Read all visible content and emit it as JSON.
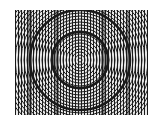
{
  "image": {
    "description": "Moire pattern of concentric circles overlaid on vertical lines",
    "background": "#ffffff",
    "ink": "#1a1a1a",
    "bounds": {
      "x": 15,
      "y": 10,
      "width": 133,
      "height": 105
    },
    "center": {
      "x": 80,
      "y": 60
    },
    "line_spacing": 3,
    "ring_spacing": 3,
    "dark_rings": [
      28,
      50
    ],
    "dark_bands_x": [
      30,
      57,
      103,
      128
    ]
  }
}
